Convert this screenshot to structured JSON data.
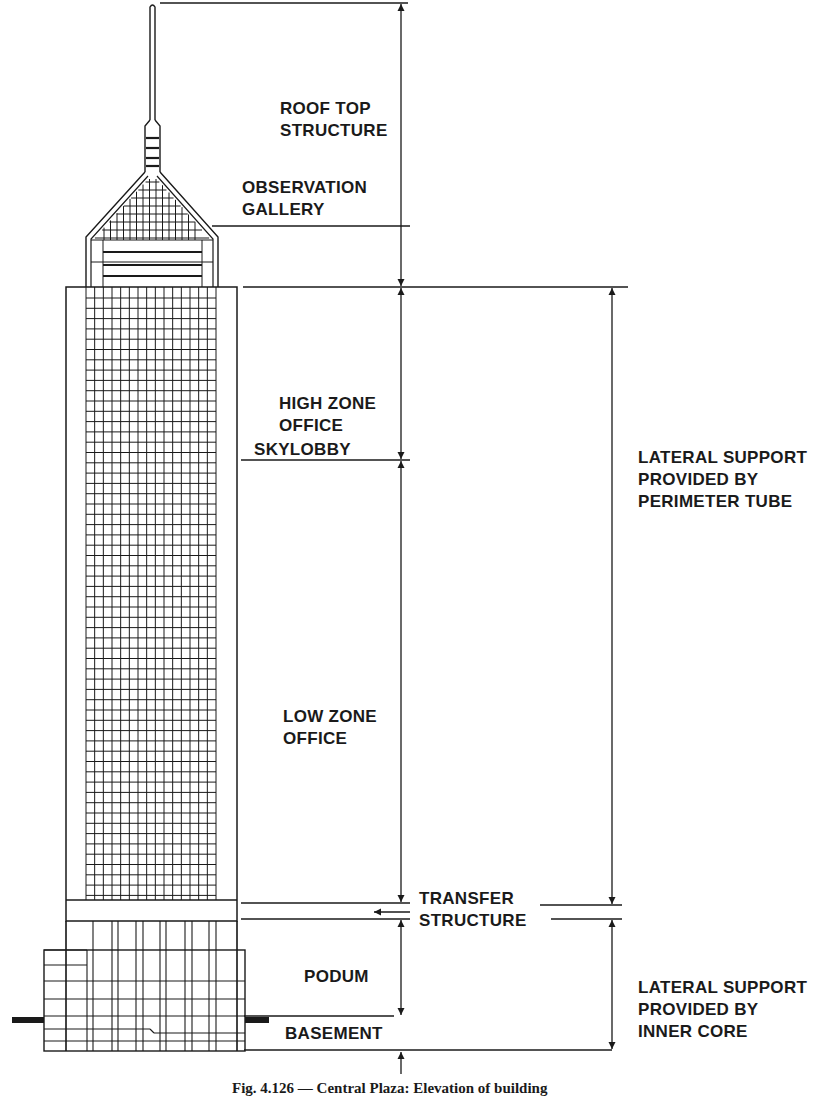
{
  "figure": {
    "caption": "Fig. 4.126 — Central Plaza: Elevation of building",
    "line_color": "#1a1a1a",
    "background": "#ffffff"
  },
  "labels": {
    "roof_top_structure": [
      "ROOF TOP",
      "STRUCTURE"
    ],
    "observation_gallery": [
      "OBSERVATION",
      "GALLERY"
    ],
    "high_zone_office": [
      "HIGH ZONE",
      "OFFICE"
    ],
    "skylobby": "SKYLOBBY",
    "low_zone_office": [
      "LOW ZONE",
      "OFFICE"
    ],
    "transfer_structure": [
      "TRANSFER",
      "STRUCTURE"
    ],
    "podium": "PODUM",
    "basement": "BASEMENT",
    "lateral_support_tube": [
      "LATERAL SUPPORT",
      "PROVIDED BY",
      "PERIMETER TUBE"
    ],
    "lateral_support_core": [
      "LATERAL SUPPORT",
      "PROVIDED BY",
      "INNER CORE"
    ]
  },
  "building": {
    "zones": [
      {
        "name": "Roof top structure",
        "from_y": 3,
        "to_y": 287
      },
      {
        "name": "High zone office",
        "from_y": 287,
        "to_y": 460
      },
      {
        "name": "Low zone office",
        "from_y": 460,
        "to_y": 910
      },
      {
        "name": "Transfer structure",
        "from_y": 910,
        "to_y": 927
      },
      {
        "name": "Podium",
        "from_y": 927,
        "to_y": 1016
      },
      {
        "name": "Basement",
        "from_y": 1016,
        "to_y": 1053
      }
    ],
    "lateral_support": [
      {
        "system": "Perimeter tube",
        "from_y": 287,
        "to_y": 910
      },
      {
        "system": "Inner core",
        "from_y": 927,
        "to_y": 1051
      }
    ],
    "tower_grid_columns": 15
  }
}
